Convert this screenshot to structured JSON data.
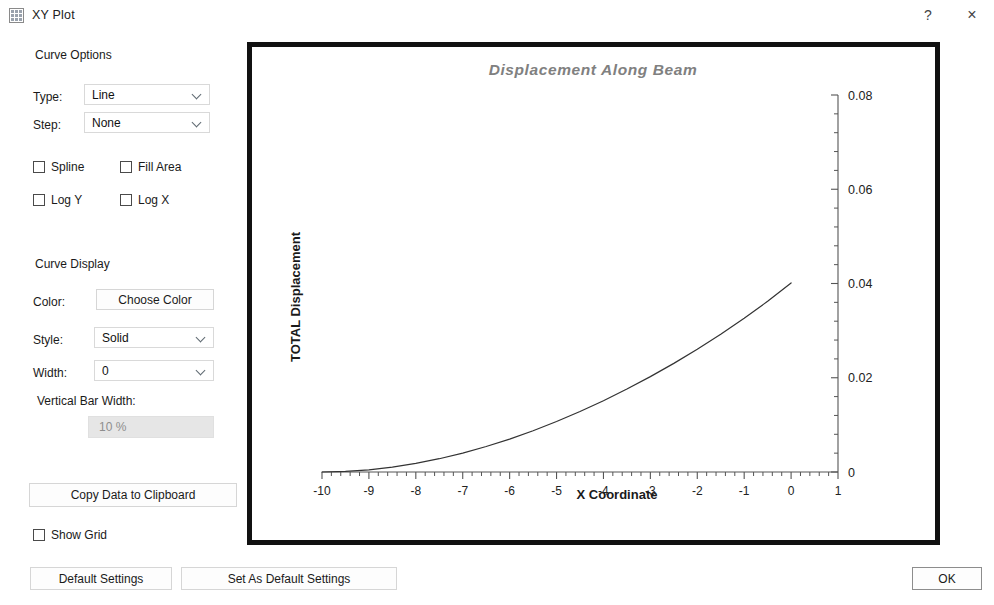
{
  "window": {
    "title": "XY Plot",
    "icon": "grid-icon",
    "help_label": "?",
    "close_label": "×"
  },
  "options": {
    "curve_options_heading": "Curve Options",
    "type_label": "Type:",
    "type_value": "Line",
    "type_options": [
      "Line"
    ],
    "step_label": "Step:",
    "step_value": "None",
    "step_options": [
      "None"
    ],
    "checkboxes": [
      {
        "label": "Spline",
        "checked": false
      },
      {
        "label": "Fill Area",
        "checked": false
      },
      {
        "label": "Log Y",
        "checked": false
      },
      {
        "label": "Log X",
        "checked": false
      }
    ],
    "curve_display_heading": "Curve Display",
    "color_label": "Color:",
    "choose_color_label": "Choose Color",
    "style_label": "Style:",
    "style_value": "Solid",
    "style_options": [
      "Solid"
    ],
    "width_label": "Width:",
    "width_value": "0",
    "width_options": [
      "0"
    ],
    "vertical_bar_width_label": "Vertical Bar Width:",
    "vertical_bar_width_value": "10 %",
    "copy_data_label": "Copy Data to Clipboard",
    "show_grid_label": "Show Grid",
    "show_grid_checked": false
  },
  "buttons": {
    "default_settings": "Default Settings",
    "set_as_default_settings": "Set As Default Settings",
    "ok": "OK"
  },
  "colors": {
    "chart_frame": "#111111",
    "curve": "#333333",
    "axis": "#555555",
    "title_text": "#808080",
    "disabled_field_bg": "#e6e6e6"
  },
  "chart_data": {
    "type": "line",
    "title": "Displacement Along Beam",
    "xlabel": "X Coordinate",
    "ylabel": "TOTAL Displacement",
    "xlim": [
      -10,
      1
    ],
    "ylim": [
      0,
      0.08
    ],
    "xticks": [
      -10,
      -9,
      -8,
      -7,
      -6,
      -5,
      -4,
      -3,
      -2,
      -1,
      0,
      1
    ],
    "xticklabels": [
      "-10",
      "-9",
      "-8",
      "-7",
      "-6",
      "-5",
      "-4",
      "-3",
      "-2",
      "-1",
      "0",
      "1"
    ],
    "yticks": [
      0,
      0.02,
      0.04,
      0.06,
      0.08
    ],
    "yticklabels": [
      "0",
      "0.02",
      "0.04",
      "0.06",
      "0.08"
    ],
    "x_minor_per_major": 5,
    "y_minor_per_major": 5,
    "y_axis_side": "right",
    "grid": false,
    "legend": null,
    "series": [
      {
        "name": "TOTAL Displacement",
        "x": [
          -10.0,
          -9.5,
          -9.0,
          -8.5,
          -8.0,
          -7.5,
          -7.0,
          -6.5,
          -6.0,
          -5.5,
          -5.0,
          -4.5,
          -4.0,
          -3.5,
          -3.0,
          -2.5,
          -2.0,
          -1.5,
          -1.0,
          -0.5,
          0.0
        ],
        "y": [
          0.0,
          0.00012,
          0.00047,
          0.00104,
          0.00183,
          0.00282,
          0.00402,
          0.00541,
          0.00699,
          0.00876,
          0.01071,
          0.01283,
          0.01513,
          0.0176,
          0.02024,
          0.02305,
          0.02604,
          0.02922,
          0.03261,
          0.03623,
          0.04012
        ]
      }
    ]
  }
}
